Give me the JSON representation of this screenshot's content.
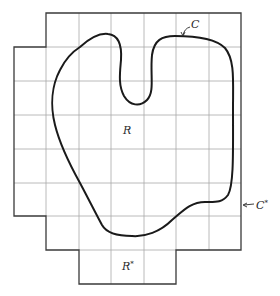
{
  "figure": {
    "labels": {
      "region": "R",
      "outer_region": "R",
      "outer_region_sup": "*",
      "curve": "C",
      "outer_curve": "C",
      "outer_curve_sup": "*"
    },
    "colors": {
      "grid": "#9a9a9a",
      "outline": "#3a3a3a",
      "curve": "#1a1a1a",
      "background": "#ffffff"
    },
    "grid": {
      "x_lines": [
        14,
        46,
        79,
        111,
        144,
        176,
        209,
        241
      ],
      "y_lines": [
        13,
        47,
        81,
        115,
        149,
        183,
        216,
        250,
        284
      ]
    }
  }
}
